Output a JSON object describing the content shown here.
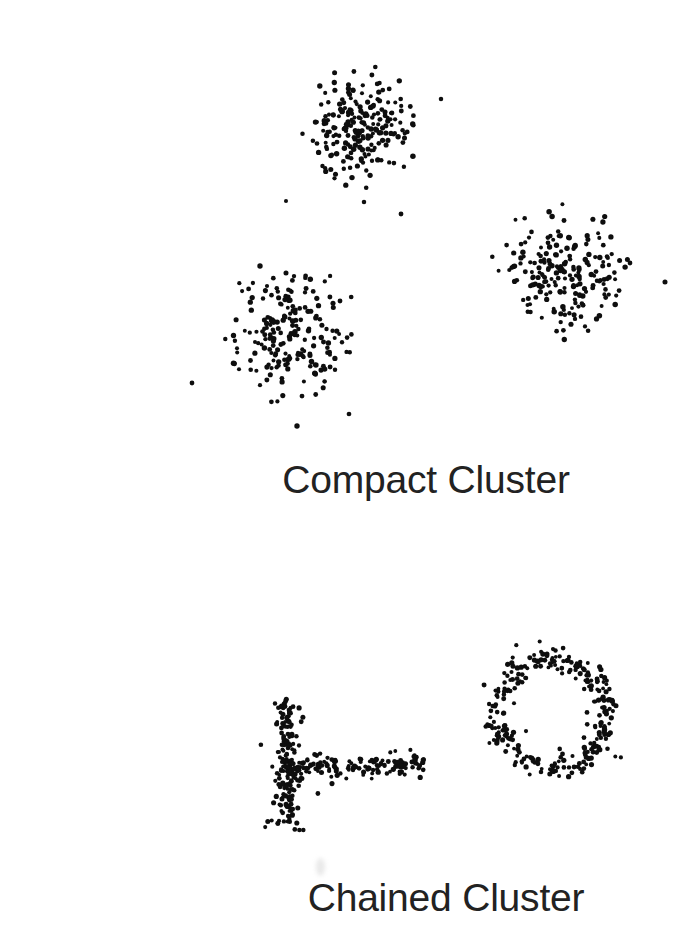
{
  "page": {
    "background_color": "#ffffff",
    "ink_color": "#222222"
  },
  "figures": {
    "compact": {
      "label": "Compact Cluster"
    },
    "chained": {
      "label": "Chained Cluster"
    }
  },
  "artifacts": [
    {
      "name": "scan-smudge",
      "x": 316,
      "y": 858,
      "width": 9,
      "height": 18,
      "color": "#e9e9e9"
    }
  ],
  "chart_data": [
    {
      "id": "compact",
      "type": "scatter",
      "title": "Compact Cluster",
      "description": "Three dense Gaussian point blobs on a white background, no axes",
      "dot_color": "#0e0e0e",
      "dot_radius": 2.3,
      "clusters": [
        {
          "name": "top-blob",
          "center_x": 362,
          "center_y": 127,
          "std_x": 28,
          "std_y": 27,
          "count": 215,
          "max_sigma": 2.4
        },
        {
          "name": "right-blob",
          "center_x": 564,
          "center_y": 272,
          "std_x": 33,
          "std_y": 30,
          "count": 205,
          "max_sigma": 2.4
        },
        {
          "name": "bottom-left-blob",
          "center_x": 290,
          "center_y": 334,
          "std_x": 30,
          "std_y": 31,
          "count": 205,
          "max_sigma": 2.4
        }
      ],
      "outlier_points": [
        {
          "x": 286,
          "y": 201
        },
        {
          "x": 364,
          "y": 202
        },
        {
          "x": 401,
          "y": 214
        },
        {
          "x": 192,
          "y": 383
        },
        {
          "x": 665,
          "y": 282
        },
        {
          "x": 297,
          "y": 426
        },
        {
          "x": 260,
          "y": 266
        },
        {
          "x": 441,
          "y": 99
        },
        {
          "x": 349,
          "y": 414
        }
      ]
    },
    {
      "id": "chained",
      "type": "scatter",
      "title": "Chained Cluster",
      "description": "Elongated chained point shapes: a T/turnstile shape made of two dense bars and a ring annulus, no axes",
      "dot_color": "#0e0e0e",
      "dot_radius": 2.2,
      "shapes": [
        {
          "kind": "segment",
          "name": "t-vertical-bar",
          "x1": 287,
          "y1": 703,
          "x2": 287,
          "y2": 831,
          "jitter": 5.5,
          "count": 175,
          "stray_fraction": 0.1,
          "stray_scale": 2.4
        },
        {
          "kind": "segment",
          "name": "t-horizontal-bar",
          "x1": 280,
          "y1": 766,
          "x2": 426,
          "y2": 766,
          "jitter": 5.5,
          "count": 170,
          "stray_fraction": 0.1,
          "stray_scale": 2.4
        },
        {
          "kind": "ring",
          "name": "ring",
          "center_x": 552,
          "center_y": 714,
          "radius": 54,
          "jitter": 6.5,
          "count": 290,
          "stray_fraction": 0.08,
          "stray_scale": 2.2
        }
      ]
    }
  ]
}
